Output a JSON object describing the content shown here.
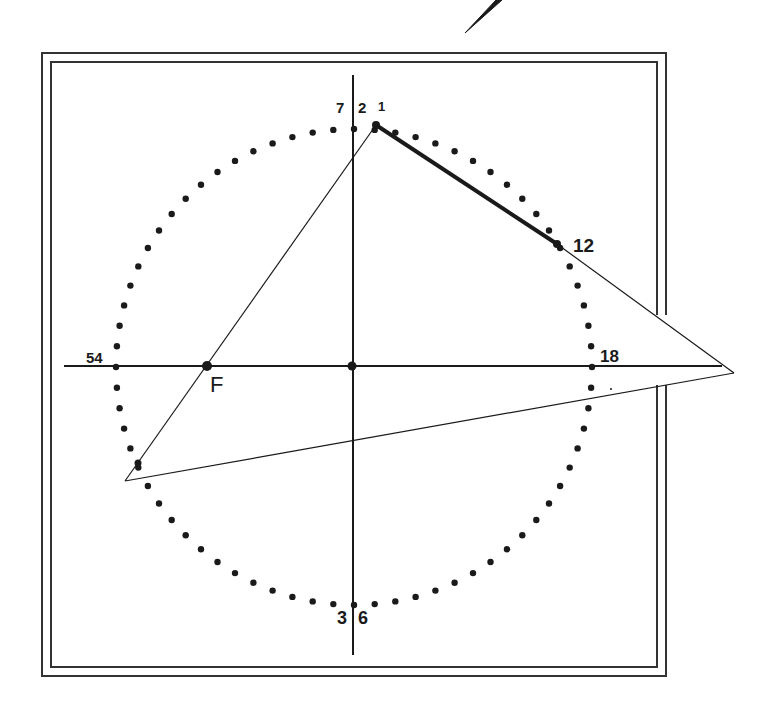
{
  "diagram": {
    "type": "modular-multiplication-circle",
    "circle": {
      "center": [
        354,
        367
      ],
      "radius": 238,
      "num_points": 72,
      "dot_color": "#1a1a1a"
    },
    "axes": {
      "horizontal": {
        "from": [
          64,
          366
        ],
        "to": [
          722,
          366
        ]
      },
      "vertical": {
        "from": [
          353,
          75
        ],
        "to": [
          353,
          655
        ]
      }
    },
    "frame": {
      "outer": {
        "x": 42,
        "y": 53,
        "w": 624,
        "h": 623
      },
      "inner": {
        "x": 51,
        "y": 62,
        "w": 606,
        "h": 605
      },
      "right_gap": {
        "from_y": 315,
        "to_y": 385
      }
    },
    "labels": {
      "top_left": "7",
      "top_mid": "2",
      "top_right": "1",
      "p12": "12",
      "p18": "18",
      "p54": "54",
      "bottom_left": "3",
      "bottom_right": "6",
      "focus": "F"
    },
    "points": {
      "p1": [
        376,
        125
      ],
      "p12": [
        557,
        244
      ],
      "apex_right": [
        734,
        373
      ],
      "apex_left": [
        125,
        481
      ],
      "focus": [
        207,
        366
      ],
      "center": [
        352,
        366
      ],
      "left_mark": [
        138,
        463
      ]
    },
    "segments": {
      "thick": {
        "from": "p1",
        "to": "p12",
        "width": 4
      },
      "thin": [
        {
          "from": "p1",
          "to": "apex_left"
        },
        {
          "from": "p12",
          "to": "apex_right"
        },
        {
          "from": "apex_left",
          "to": "apex_right"
        }
      ]
    },
    "pencil_stroke": {
      "from": [
        465,
        33
      ],
      "to": [
        500,
        0
      ]
    },
    "ink_color": "#1a1a1a",
    "frame_color": "#333333"
  }
}
